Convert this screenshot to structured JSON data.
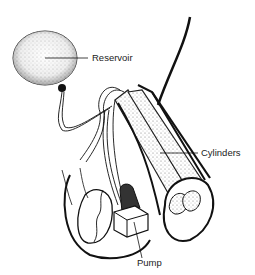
{
  "figure": {
    "labels": {
      "reservoir": "Reservoir",
      "cylinders": "Cylinders",
      "pump": "Pump"
    },
    "colors": {
      "line": "#111111",
      "stipple": "#555555",
      "background": "#ffffff"
    }
  }
}
